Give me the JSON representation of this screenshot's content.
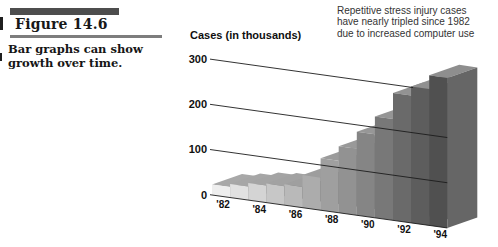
{
  "figure": {
    "label": "Figure 14.6",
    "caption_lines": [
      "Bar graphs can show",
      "growth over time."
    ]
  },
  "annotation": {
    "lines": [
      "Repetitive stress injury cases",
      "have nearly tripled since 1982",
      "due to increased computer use"
    ]
  },
  "chart_data": {
    "type": "bar",
    "style": "3d-oblique-grayscale",
    "title": "",
    "ylabel": "Cases (in thousands)",
    "xlabel": "",
    "categories": [
      "1982",
      "1983",
      "1984",
      "1985",
      "1986",
      "1987",
      "1988",
      "1989",
      "1990",
      "1991",
      "1992",
      "1993",
      "1994"
    ],
    "values": [
      23,
      30,
      38,
      42,
      46,
      72,
      115,
      147,
      185,
      224,
      282,
      302,
      332
    ],
    "x_tick_labels": [
      "'82",
      "'84",
      "'86",
      "'88",
      "'90",
      "'92",
      "'94"
    ],
    "y_ticks": [
      0,
      100,
      200,
      300
    ],
    "ylim": [
      0,
      300
    ],
    "grid": "diagonal-perspective-lines",
    "legend": "none",
    "colors": {
      "front_light": "#eeeeee",
      "front_dark": "#505050",
      "top_light": "#a8a8a8",
      "top_dark": "#8e8e8e",
      "side": "#666666",
      "gridline": "#1c1c1c",
      "label_text": "#101010"
    }
  }
}
